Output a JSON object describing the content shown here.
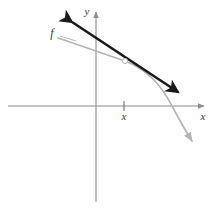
{
  "figure": {
    "background_color": "#ffffff"
  },
  "axes": {
    "x_axis_label": "x",
    "y_axis_label": "y",
    "axis_color": "#8c8c8c",
    "origin": {
      "x": 96,
      "y": 106
    },
    "x_axis": {
      "x_start": 8,
      "x_end": 208,
      "y": 106,
      "arrow_end": "right"
    },
    "y_axis": {
      "y_start": 8,
      "y_end": 202,
      "x": 96,
      "arrow_end": "top"
    },
    "tick": {
      "label": "x",
      "x": 124,
      "y": 106,
      "half_height": 5,
      "label_y": 120
    }
  },
  "curve": {
    "name": "f",
    "label": "f",
    "label_x": 52,
    "label_y": 37,
    "color": "#b4b4b4",
    "stroke_width": 1.6,
    "path": "M 58 38 C 82 46, 104 54, 125 61 C 146 69, 162 86, 172 106 C 180 121, 187 133, 192 141",
    "arrow_end": "bottom-right",
    "leader_line": {
      "x1": 60,
      "y1": 36,
      "x2": 76,
      "y2": 41
    }
  },
  "tangent_line": {
    "color": "#1a1a1a",
    "stroke_width": 2.6,
    "x1": 72,
    "y1": 22,
    "x2": 178,
    "y2": 92,
    "arrow_start": "upper-left",
    "arrow_end": "lower-right",
    "tangency_point": {
      "x": 125,
      "y": 61,
      "radius": 2.6,
      "fill": "#ffffff",
      "stroke": "#b4b4b4"
    }
  },
  "chart_data": {
    "type": "line",
    "xlabel": "x",
    "ylabel": "y",
    "grid": false,
    "legend": null,
    "annotations": [
      {
        "text": "f",
        "target": "curve",
        "x": 52,
        "y": 37
      },
      {
        "text": "x",
        "target": "x-axis tick",
        "x": 124,
        "y": 120
      },
      {
        "text": "y",
        "target": "y-axis",
        "x": 90,
        "y": 12
      },
      {
        "text": "x",
        "target": "x-axis",
        "x": 203,
        "y": 120
      }
    ],
    "series": [
      {
        "name": "f",
        "type": "curve",
        "concavity": "down",
        "color": "#b4b4b4",
        "points": [
          {
            "x": 58,
            "y": 38
          },
          {
            "x": 82,
            "y": 46
          },
          {
            "x": 104,
            "y": 54
          },
          {
            "x": 125,
            "y": 61
          },
          {
            "x": 146,
            "y": 69
          },
          {
            "x": 162,
            "y": 86
          },
          {
            "x": 172,
            "y": 106
          },
          {
            "x": 182,
            "y": 124
          },
          {
            "x": 192,
            "y": 141
          }
        ]
      },
      {
        "name": "tangent",
        "type": "line",
        "color": "#1a1a1a",
        "points": [
          {
            "x": 72,
            "y": 22
          },
          {
            "x": 178,
            "y": 92
          }
        ]
      }
    ]
  }
}
